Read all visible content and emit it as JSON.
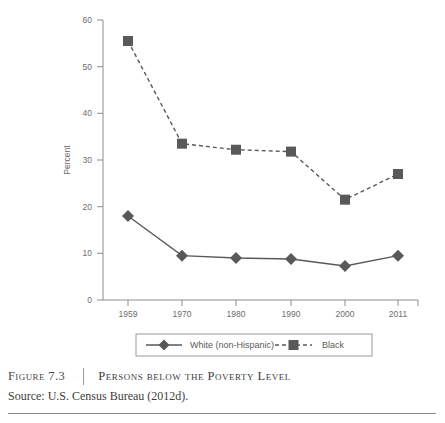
{
  "figure": {
    "label": "Figure 7.3",
    "title": "Persons below the Poverty Level",
    "source": "Source: U.S. Census Bureau (2012d)."
  },
  "colors": {
    "series_line": "#595959",
    "axis": "#8d8d8d",
    "tick_label": "#6d6d6d",
    "caption_text": "#3d3d3d",
    "legend_border": "#9a9a9a",
    "rule": "#8d8d8d"
  },
  "chart_data": {
    "type": "line",
    "title": "",
    "xlabel": "",
    "ylabel": "Percent",
    "categories": [
      "1959",
      "1970",
      "1980",
      "1990",
      "2000",
      "2011"
    ],
    "ylim": [
      0,
      60
    ],
    "yticks": [
      "0",
      "10",
      "20",
      "30",
      "40",
      "50",
      "60"
    ],
    "grid": false,
    "legend_position": "bottom",
    "series": [
      {
        "name": "White (non-Hispanic)",
        "marker": "diamond",
        "linestyle": "solid",
        "values": [
          18.0,
          9.5,
          9.0,
          8.8,
          7.3,
          9.5
        ]
      },
      {
        "name": "Black",
        "marker": "square",
        "linestyle": "dashed",
        "values": [
          55.5,
          33.5,
          32.2,
          31.8,
          21.5,
          27.0
        ]
      }
    ]
  }
}
